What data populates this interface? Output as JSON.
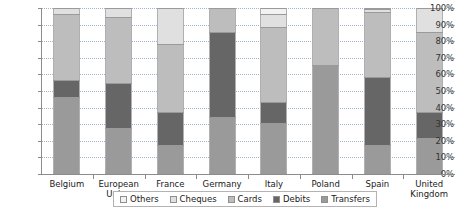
{
  "chart_data": {
    "type": "bar",
    "subtype": "stacked-percentage",
    "title": "",
    "subtitle": "",
    "xlabel": "",
    "ylabel": "",
    "ylim": [
      0,
      100
    ],
    "yticks": [
      "0%",
      "10%",
      "20%",
      "30%",
      "40%",
      "50%",
      "60%",
      "70%",
      "80%",
      "90%",
      "100%"
    ],
    "ytick_values": [
      0,
      10,
      20,
      30,
      40,
      50,
      60,
      70,
      80,
      90,
      100
    ],
    "grid": true,
    "legend_position": "bottom",
    "categories": [
      "Belgium",
      "European Union",
      "France",
      "Germany",
      "Italy",
      "Poland",
      "Spain",
      "United Kingdom"
    ],
    "category_labels": [
      "Belgium",
      "European\nUnion",
      "France",
      "Germany",
      "Italy",
      "Poland",
      "Spain",
      "United\nKingdom"
    ],
    "series": [
      {
        "name": "Transfers",
        "color": "#9a9a9a",
        "values": [
          46,
          27,
          17,
          34,
          30,
          65,
          17,
          21
        ]
      },
      {
        "name": "Debits",
        "color": "#666666",
        "values": [
          10,
          27,
          20,
          51,
          13,
          0,
          41,
          16
        ]
      },
      {
        "name": "Cards",
        "color": "#bdbdbd",
        "values": [
          40,
          40,
          41,
          15,
          45,
          35,
          39,
          48
        ]
      },
      {
        "name": "Cheques",
        "color": "#e0e0e0",
        "values": [
          4,
          6,
          22,
          0,
          8,
          0,
          2,
          15
        ]
      },
      {
        "name": "Others",
        "color": "#f2f2f2",
        "values": [
          0,
          0,
          0,
          0,
          4,
          0,
          1,
          0
        ]
      }
    ],
    "stack_order_bottom_to_top": [
      "Transfers",
      "Debits",
      "Cards",
      "Cheques",
      "Others"
    ]
  },
  "legend": {
    "items": [
      {
        "label": "Others",
        "color": "#f2f2f2"
      },
      {
        "label": "Cheques",
        "color": "#e0e0e0"
      },
      {
        "label": "Cards",
        "color": "#bdbdbd"
      },
      {
        "label": "Debits",
        "color": "#666666"
      },
      {
        "label": "Transfers",
        "color": "#9a9a9a"
      }
    ]
  },
  "style": {
    "gridline_color": "#9fb6cd",
    "axis_color": "#8c8c8c",
    "bar_border_color": "#9a9a9a",
    "background": "#ffffff",
    "text_color": "#1a1a1a"
  }
}
